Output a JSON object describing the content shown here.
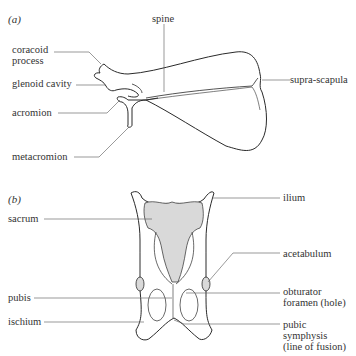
{
  "panels": {
    "a": {
      "label": "(a)",
      "labels": {
        "spine": "spine",
        "coracoid_1": "coracoid",
        "coracoid_2": "process",
        "glenoid": "glenoid cavity",
        "acromion": "acromion",
        "metacromion": "metacromion",
        "suprascapula": "supra-scapula"
      }
    },
    "b": {
      "label": "(b)",
      "labels": {
        "sacrum": "sacrum",
        "pubis": "pubis",
        "ischium": "ischium",
        "ilium": "ilium",
        "acetabulum": "acetabulum",
        "obturator_1": "obturator",
        "obturator_2": "foramen (hole)",
        "pubic_1": "pubic",
        "pubic_2": "symphysis",
        "pubic_3": "(line of fusion)"
      }
    }
  },
  "colors": {
    "outline": "#2a2a2a",
    "leader": "#555555",
    "sacrum_fill": "#d9d9d9"
  }
}
